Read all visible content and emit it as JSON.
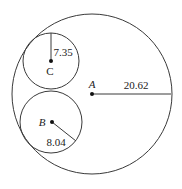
{
  "diagram": {
    "stroke_color": "#3a3a3a",
    "circles": [
      {
        "id": "A",
        "label": "A",
        "radius_value": "20.62",
        "cx": 92,
        "cy": 94,
        "r": 80,
        "radius_line": {
          "x2": 171,
          "y2": 94
        },
        "label_pos": {
          "x": 92,
          "y": 88
        },
        "value_pos": {
          "x": 136,
          "y": 89
        }
      },
      {
        "id": "C",
        "label": "C",
        "radius_value": "7.35",
        "cx": 51,
        "cy": 61,
        "r": 28,
        "radius_line": {
          "x2": 51,
          "y2": 33
        },
        "label_pos": {
          "x": 50,
          "y": 75
        },
        "value_pos": {
          "x": 63,
          "y": 56
        }
      },
      {
        "id": "B",
        "label": "B",
        "radius_value": "8.04",
        "cx": 51,
        "cy": 122,
        "r": 31,
        "radius_line": {
          "x2": 76,
          "y2": 141
        },
        "label_pos": {
          "x": 42,
          "y": 126
        },
        "value_pos": {
          "x": 56,
          "y": 146
        }
      }
    ]
  }
}
